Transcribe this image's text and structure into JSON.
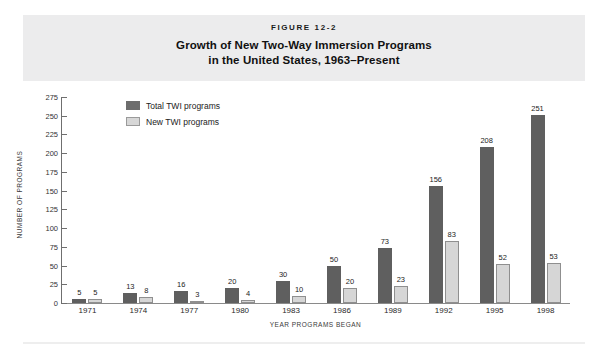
{
  "figure": {
    "number": "FIGURE 12-2",
    "title_line1": "Growth of New Two-Way Immersion Programs",
    "title_line2": "in the United States, 1963–Present"
  },
  "colors": {
    "total_bar": "#5f5f5f",
    "new_bar": "#d6d6d6",
    "new_bar_border": "#8f8f8f",
    "header_band": "#ececed",
    "axis": "#6f6f6f"
  },
  "legend": {
    "position": "top-left-inside",
    "items": [
      {
        "label": "Total TWI programs",
        "color": "#6d6d6d"
      },
      {
        "label": "New TWI programs",
        "color": "#d7d7d7"
      }
    ]
  },
  "axes": {
    "y_title": "NUMBER OF PROGRAMS",
    "x_title": "YEAR PROGRAMS BEGAN",
    "y_ticks": [
      "275",
      "250",
      "225",
      "200",
      "175",
      "150",
      "125",
      "100",
      "75",
      "50",
      "25",
      "0"
    ]
  },
  "chart_data": {
    "type": "bar",
    "title": "Growth of New Two-Way Immersion Programs in the United States, 1963–Present",
    "xlabel": "YEAR PROGRAMS BEGAN",
    "ylabel": "NUMBER OF PROGRAMS",
    "ylim": [
      0,
      275
    ],
    "ytick_step": 25,
    "grid": false,
    "legend_position": "upper left",
    "categories": [
      "1971",
      "1974",
      "1977",
      "1980",
      "1983",
      "1986",
      "1989",
      "1992",
      "1995",
      "1998"
    ],
    "series": [
      {
        "name": "Total TWI programs",
        "color": "#5f5f5f",
        "values": [
          5,
          13,
          16,
          20,
          30,
          50,
          73,
          156,
          208,
          251
        ]
      },
      {
        "name": "New TWI programs",
        "color": "#d6d6d6",
        "values": [
          5,
          8,
          3,
          4,
          10,
          20,
          23,
          83,
          52,
          53
        ]
      }
    ]
  }
}
